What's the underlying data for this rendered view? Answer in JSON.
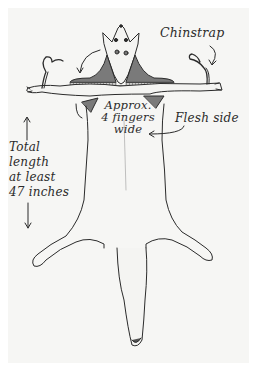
{
  "diagram": {
    "background_color": "#f6f6f4",
    "ink_color": "#2b2b2b",
    "shading_color": "#7a7a7a",
    "labels": {
      "chinstrap": "Chinstrap",
      "approx_line1": "Approx.",
      "approx_line2": "4 fingers",
      "approx_line3": "wide",
      "flesh_side": "Flesh side",
      "total_line1": "Total",
      "total_line2": "length",
      "total_line3": "at least",
      "total_line4": "47 inches"
    },
    "arrows": [
      {
        "name": "chinstrap-arrow",
        "points_to": "right ear strap"
      },
      {
        "name": "left-curved-arrow",
        "points_to": "left shaded neck flap"
      },
      {
        "name": "approx-arrow",
        "points_to": "left armpit gusset"
      },
      {
        "name": "flesh-side-arrow",
        "points_to": "center of pelt"
      },
      {
        "name": "length-up-arrow",
        "direction": "up"
      },
      {
        "name": "length-down-arrow",
        "direction": "down"
      }
    ]
  }
}
